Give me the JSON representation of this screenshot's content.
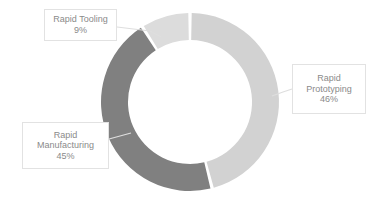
{
  "chart_data": {
    "type": "pie",
    "variant": "donut",
    "title": "",
    "subtitle": "",
    "xlabel": "",
    "ylabel": "",
    "grid": false,
    "legend_position": "none",
    "labels_position": "callout",
    "categories": [
      "Rapid Prototyping",
      "Rapid Manufacturing",
      "Rapid Tooling"
    ],
    "values": [
      46,
      45,
      9
    ],
    "value_suffix": "%",
    "slices": [
      {
        "label": "Rapid Prototyping",
        "value": 46,
        "value_text": "46%",
        "color": "#d2d2d2",
        "start_angle_deg": 0,
        "end_angle_deg": 165.6
      },
      {
        "label": "Rapid Manufacturing",
        "value": 45,
        "value_text": "45%",
        "color": "#808080",
        "start_angle_deg": 165.6,
        "end_angle_deg": 327.6
      },
      {
        "label": "Rapid Tooling",
        "value": 9,
        "value_text": "9%",
        "color": "#dcdcdc",
        "start_angle_deg": 327.6,
        "end_angle_deg": 360
      }
    ],
    "geometry": {
      "center_x": 190,
      "center_y": 102,
      "outer_radius": 89,
      "inner_radius": 62,
      "start_at_12_oclock": true,
      "direction": "clockwise",
      "gap_degrees": 2.2
    },
    "colors": {
      "slice_prototyping": "#d2d2d2",
      "slice_manufacturing": "#808080",
      "slice_tooling": "#dcdcdc",
      "background": "#ffffff",
      "label_text": "#8a8a8a",
      "label_border": "#e2e2e2",
      "leader_line": "#d8d8d8"
    }
  },
  "callouts": {
    "tooling": {
      "category": "Rapid Tooling",
      "percent": "9%"
    },
    "prototyping": {
      "category_line1": "Rapid",
      "category_line2": "Prototyping",
      "percent": "46%"
    },
    "manufacturing": {
      "category_line1": "Rapid",
      "category_line2": "Manufacturing",
      "percent": "45%"
    }
  }
}
